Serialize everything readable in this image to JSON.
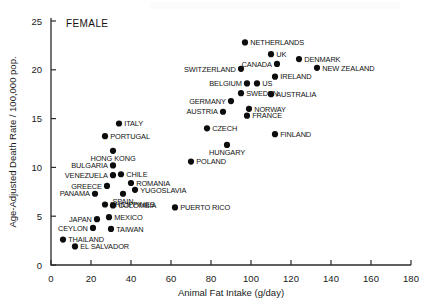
{
  "chart_data": {
    "type": "scatter",
    "title": "",
    "annotation": "FEMALE",
    "xlabel": "Animal Fat Intake (g/day)",
    "ylabel": "Age-Adjusted Death Rate / 100,000 pop.",
    "xlim": [
      0,
      180
    ],
    "ylim": [
      0,
      25
    ],
    "xticks": [
      0,
      20,
      40,
      60,
      80,
      100,
      120,
      140,
      160,
      180
    ],
    "yticks": [
      0,
      5,
      10,
      15,
      20,
      25
    ],
    "grid": false,
    "legend": "none",
    "points": [
      {
        "label": "NETHERLANDS",
        "x": 97,
        "y": 22.8,
        "anchor": "right"
      },
      {
        "label": "UK",
        "x": 110,
        "y": 21.6,
        "anchor": "right"
      },
      {
        "label": "DENMARK",
        "x": 124,
        "y": 21.1,
        "anchor": "right"
      },
      {
        "label": "CANADA",
        "x": 113,
        "y": 20.6,
        "anchor": "left"
      },
      {
        "label": "NEW ZEALAND",
        "x": 133,
        "y": 20.2,
        "anchor": "right"
      },
      {
        "label": "SWITZERLAND",
        "x": 95,
        "y": 20.1,
        "anchor": "left"
      },
      {
        "label": "IRELAND",
        "x": 112,
        "y": 19.3,
        "anchor": "right"
      },
      {
        "label": "BELGIUM",
        "x": 98,
        "y": 18.6,
        "anchor": "left"
      },
      {
        "label": "US",
        "x": 103,
        "y": 18.6,
        "anchor": "right"
      },
      {
        "label": "SWEDEN",
        "x": 95,
        "y": 17.6,
        "anchor": "right"
      },
      {
        "label": "AUSTRALIA",
        "x": 110,
        "y": 17.5,
        "anchor": "right"
      },
      {
        "label": "GERMANY",
        "x": 90,
        "y": 16.8,
        "anchor": "left"
      },
      {
        "label": "NORWAY",
        "x": 99,
        "y": 16.0,
        "anchor": "right"
      },
      {
        "label": "AUSTRIA",
        "x": 86,
        "y": 15.7,
        "anchor": "left"
      },
      {
        "label": "FRANCE",
        "x": 98,
        "y": 15.3,
        "anchor": "right"
      },
      {
        "label": "ITALY",
        "x": 34,
        "y": 14.5,
        "anchor": "right"
      },
      {
        "label": "CZECH",
        "x": 78,
        "y": 14.0,
        "anchor": "right"
      },
      {
        "label": "FINLAND",
        "x": 112,
        "y": 13.4,
        "anchor": "right"
      },
      {
        "label": "PORTUGAL",
        "x": 27,
        "y": 13.2,
        "anchor": "right"
      },
      {
        "label": "HONG KONG",
        "x": 31,
        "y": 11.7,
        "anchor": "below"
      },
      {
        "label": "HUNGARY",
        "x": 88,
        "y": 12.3,
        "anchor": "below"
      },
      {
        "label": "POLAND",
        "x": 70,
        "y": 10.6,
        "anchor": "right"
      },
      {
        "label": "BULGARIA",
        "x": 31,
        "y": 10.2,
        "anchor": "left"
      },
      {
        "label": "CHILE",
        "x": 35,
        "y": 9.3,
        "anchor": "right"
      },
      {
        "label": "VENEZUELA",
        "x": 31,
        "y": 9.2,
        "anchor": "left"
      },
      {
        "label": "ROMANIA",
        "x": 40,
        "y": 8.4,
        "anchor": "right"
      },
      {
        "label": "GREECE",
        "x": 28,
        "y": 8.1,
        "anchor": "left"
      },
      {
        "label": "YUGOSLAVIA",
        "x": 42,
        "y": 7.7,
        "anchor": "right"
      },
      {
        "label": "PANAMA",
        "x": 22,
        "y": 7.3,
        "anchor": "left"
      },
      {
        "label": "SPAIN",
        "x": 36,
        "y": 7.3,
        "anchor": "below"
      },
      {
        "label": "PHILIPPINES",
        "x": 27,
        "y": 6.2,
        "anchor": "right"
      },
      {
        "label": "COLOMBIA",
        "x": 31,
        "y": 6.1,
        "anchor": "right"
      },
      {
        "label": "PUERTO RICO",
        "x": 62,
        "y": 5.9,
        "anchor": "right"
      },
      {
        "label": "MEXICO",
        "x": 29,
        "y": 4.9,
        "anchor": "right"
      },
      {
        "label": "JAPAN",
        "x": 23,
        "y": 4.7,
        "anchor": "left"
      },
      {
        "label": "CEYLON",
        "x": 21,
        "y": 3.8,
        "anchor": "left"
      },
      {
        "label": "TAIWAN",
        "x": 30,
        "y": 3.7,
        "anchor": "right"
      },
      {
        "label": "THAILAND",
        "x": 6,
        "y": 2.6,
        "anchor": "right"
      },
      {
        "label": "EL SALVADOR",
        "x": 12,
        "y": 1.9,
        "anchor": "right"
      }
    ]
  }
}
